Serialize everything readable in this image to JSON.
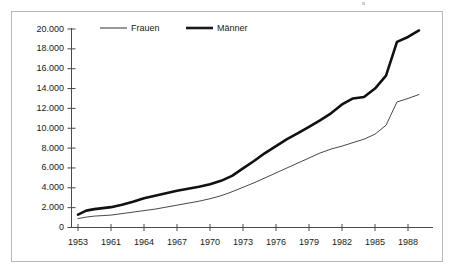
{
  "chart_data": {
    "type": "line",
    "title": "",
    "subtitle": "",
    "xlabel": "",
    "ylabel": "",
    "xlim": [
      1953,
      1989
    ],
    "ylim": [
      0,
      20000
    ],
    "grid": false,
    "legend_position": "top-left-inside",
    "y_ticks": [
      0,
      2000,
      4000,
      6000,
      8000,
      10000,
      12000,
      14000,
      16000,
      18000,
      20000
    ],
    "y_tick_labels": [
      "0",
      "2.000",
      "4.000",
      "6.000",
      "8.000",
      "10.000",
      "12.000",
      "14.000",
      "16.000",
      "18.000",
      "20.000"
    ],
    "x_ticks": [
      1953,
      1961,
      1964,
      1967,
      1970,
      1973,
      1976,
      1979,
      1982,
      1985,
      1988
    ],
    "x_tick_labels": [
      "1953",
      "1961",
      "1964",
      "1967",
      "1970",
      "1973",
      "1976",
      "1979",
      "1982",
      "1985",
      "1988"
    ],
    "x": [
      1953,
      1955,
      1957,
      1959,
      1961,
      1962,
      1963,
      1964,
      1965,
      1966,
      1967,
      1968,
      1969,
      1970,
      1971,
      1972,
      1973,
      1974,
      1975,
      1976,
      1977,
      1978,
      1979,
      1980,
      1981,
      1982,
      1983,
      1984,
      1985,
      1986,
      1987,
      1988,
      1989
    ],
    "series": [
      {
        "name": "Frauen",
        "style": "thin",
        "color": "#333333",
        "values": [
          900,
          1050,
          1150,
          1200,
          1250,
          1400,
          1550,
          1700,
          1850,
          2050,
          2250,
          2450,
          2650,
          2900,
          3200,
          3600,
          4050,
          4500,
          5000,
          5500,
          6000,
          6500,
          7000,
          7500,
          7900,
          8200,
          8550,
          8900,
          9400,
          10300,
          12650,
          13000,
          13400
        ]
      },
      {
        "name": "Männer",
        "style": "thick",
        "color": "#111111",
        "values": [
          1300,
          1700,
          1850,
          1950,
          2050,
          2300,
          2600,
          2950,
          3200,
          3450,
          3700,
          3900,
          4100,
          4350,
          4700,
          5200,
          5950,
          6700,
          7500,
          8200,
          8900,
          9500,
          10150,
          10800,
          11500,
          12400,
          13000,
          13150,
          14000,
          15300,
          18700,
          19200,
          19850
        ]
      }
    ]
  },
  "legend": {
    "items": [
      {
        "label": "Frauen",
        "style": "thin"
      },
      {
        "label": "Männer",
        "style": "thick"
      }
    ]
  }
}
